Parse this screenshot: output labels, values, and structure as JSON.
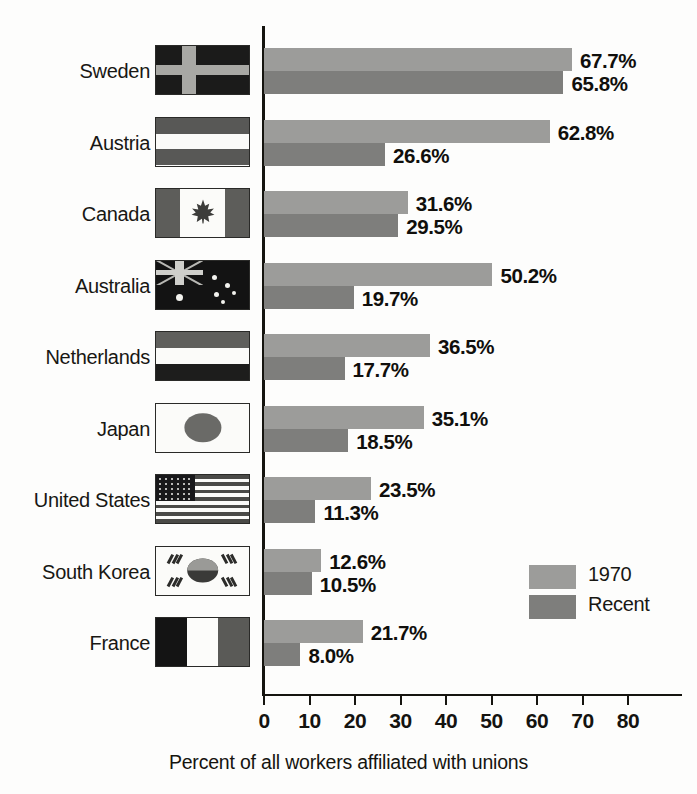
{
  "chart_data": {
    "type": "bar",
    "orientation": "horizontal",
    "title": "",
    "xlabel": "Percent of all workers affiliated with unions",
    "ylabel": "",
    "xlim": [
      0,
      85
    ],
    "xticks": [
      0,
      10,
      20,
      30,
      40,
      50,
      60,
      70,
      80
    ],
    "xtick_labels": [
      "0",
      "10",
      "20",
      "30",
      "40",
      "50",
      "60",
      "70",
      "80"
    ],
    "grid": false,
    "legend_position": "middle-right",
    "categories": [
      "Sweden",
      "Austria",
      "Canada",
      "Australia",
      "Netherlands",
      "Japan",
      "United States",
      "South Korea",
      "France"
    ],
    "series": [
      {
        "name": "1970",
        "color": "#9c9c9a",
        "values": [
          67.7,
          62.8,
          31.6,
          50.2,
          36.5,
          35.1,
          23.5,
          12.6,
          21.7
        ],
        "labels": [
          "67.7%",
          "62.8%",
          "31.6%",
          "50.2%",
          "36.5%",
          "35.1%",
          "23.5%",
          "12.6%",
          "21.7%"
        ]
      },
      {
        "name": "Recent",
        "color": "#7e7e7c",
        "values": [
          65.8,
          26.6,
          29.5,
          19.7,
          17.7,
          18.5,
          11.3,
          10.5,
          8.0
        ],
        "labels": [
          "65.8%",
          "26.6%",
          "29.5%",
          "19.7%",
          "17.7%",
          "18.5%",
          "11.3%",
          "10.5%",
          "8.0%"
        ]
      }
    ]
  },
  "rows": [
    {
      "country": "Sweden",
      "flag": "sweden-flag",
      "v1970": 67.7,
      "l1970": "67.7%",
      "vrecent": 65.8,
      "lrecent": "65.8%"
    },
    {
      "country": "Austria",
      "flag": "austria-flag",
      "v1970": 62.8,
      "l1970": "62.8%",
      "vrecent": 26.6,
      "lrecent": "26.6%"
    },
    {
      "country": "Canada",
      "flag": "canada-flag",
      "v1970": 31.6,
      "l1970": "31.6%",
      "vrecent": 29.5,
      "lrecent": "29.5%"
    },
    {
      "country": "Australia",
      "flag": "australia-flag",
      "v1970": 50.2,
      "l1970": "50.2%",
      "vrecent": 19.7,
      "lrecent": "19.7%"
    },
    {
      "country": "Netherlands",
      "flag": "netherlands-flag",
      "v1970": 36.5,
      "l1970": "36.5%",
      "vrecent": 17.7,
      "lrecent": "17.7%"
    },
    {
      "country": "Japan",
      "flag": "japan-flag",
      "v1970": 35.1,
      "l1970": "35.1%",
      "vrecent": 18.5,
      "lrecent": "18.5%"
    },
    {
      "country": "United States",
      "flag": "united-states-flag",
      "v1970": 23.5,
      "l1970": "23.5%",
      "vrecent": 11.3,
      "lrecent": "11.3%"
    },
    {
      "country": "South Korea",
      "flag": "south-korea-flag",
      "v1970": 12.6,
      "l1970": "12.6%",
      "vrecent": 10.5,
      "lrecent": "10.5%"
    },
    {
      "country": "France",
      "flag": "france-flag",
      "v1970": 21.7,
      "l1970": "21.7%",
      "vrecent": 8.0,
      "lrecent": "8.0%"
    }
  ],
  "legend": {
    "items": [
      {
        "label": "1970",
        "color": "#9c9c9a"
      },
      {
        "label": "Recent",
        "color": "#7e7e7c"
      }
    ]
  },
  "axis": {
    "xlabel": "Percent of all workers affiliated with unions",
    "ticks": [
      "0",
      "10",
      "20",
      "30",
      "40",
      "50",
      "60",
      "70",
      "80"
    ]
  },
  "colors": {
    "series_1970": "#9c9c9a",
    "series_recent": "#7e7e7c",
    "axis": "#15140f",
    "text": "#15140f",
    "background": "#fdfdfc"
  }
}
